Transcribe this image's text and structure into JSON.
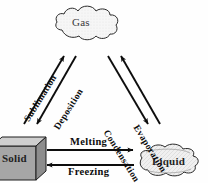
{
  "diagram": {
    "background_color": "#ffffff",
    "stroke_color": "#111111",
    "nodes": [
      {
        "id": "gas",
        "label": "Gas",
        "shape": "cloud",
        "fill": "#f2f2f2",
        "x": 88,
        "y": 27
      },
      {
        "id": "solid",
        "label": "Solid",
        "shape": "cube",
        "fill": "#a8a8a8",
        "x": 22,
        "y": 158
      },
      {
        "id": "liquid",
        "label": "Liquid",
        "shape": "puddle",
        "fill": "#ededed",
        "x": 167,
        "y": 160
      }
    ],
    "arrows": [
      {
        "id": "sublimation",
        "label": "Sublimation",
        "from": "solid",
        "to": "gas",
        "direction": "up-right"
      },
      {
        "id": "deposition",
        "label": "Deposition",
        "from": "gas",
        "to": "solid",
        "direction": "down-left"
      },
      {
        "id": "evaporation",
        "label": "Evaporation",
        "from": "liquid",
        "to": "gas",
        "direction": "up-left"
      },
      {
        "id": "condensation",
        "label": "Condensation",
        "from": "gas",
        "to": "liquid",
        "direction": "down-right"
      },
      {
        "id": "melting",
        "label": "Melting",
        "from": "solid",
        "to": "liquid",
        "direction": "right"
      },
      {
        "id": "freezing",
        "label": "Freezing",
        "from": "liquid",
        "to": "solid",
        "direction": "left"
      }
    ]
  }
}
